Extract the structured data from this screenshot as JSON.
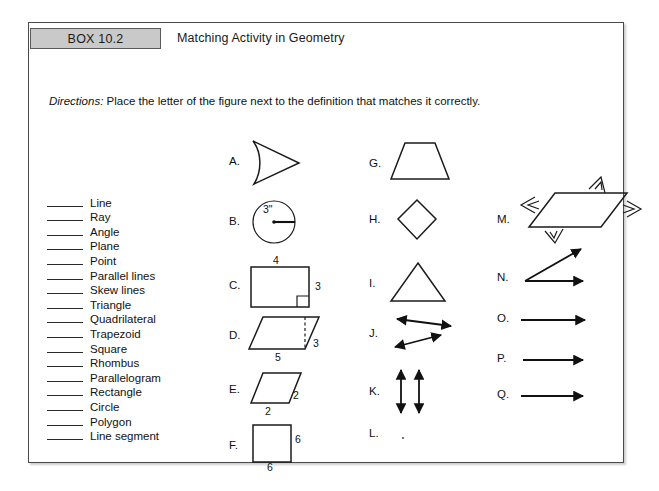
{
  "header": {
    "box_label": "BOX 10.2",
    "title": "Matching Activity in Geometry"
  },
  "directions": {
    "lead": "Directions:",
    "text": "Place the letter of the figure next to the definition that matches it correctly."
  },
  "definitions": [
    "Line",
    "Ray",
    "Angle",
    "Plane",
    "Point",
    "Parallel lines",
    "Skew lines",
    "Triangle",
    "Quadrilateral",
    "Trapezoid",
    "Square",
    "Rhombus",
    "Parallelogram",
    "Rectangle",
    "Circle",
    "Polygon",
    "Line segment"
  ],
  "figures": {
    "column1": [
      {
        "letter": "A.",
        "shape": "right-pointing-triangle",
        "dims": []
      },
      {
        "letter": "B.",
        "shape": "circle-with-radius",
        "dims": [
          "3\""
        ]
      },
      {
        "letter": "C.",
        "shape": "rectangle-with-right-angle",
        "dims": [
          "4",
          "3"
        ]
      },
      {
        "letter": "D.",
        "shape": "parallelogram-with-height",
        "dims": [
          "5",
          "3"
        ]
      },
      {
        "letter": "E.",
        "shape": "rhombus-slanted",
        "dims": [
          "2",
          "2"
        ]
      },
      {
        "letter": "F.",
        "shape": "square",
        "dims": [
          "6",
          "6"
        ]
      }
    ],
    "column2": [
      {
        "letter": "G.",
        "shape": "trapezoid",
        "dims": []
      },
      {
        "letter": "H.",
        "shape": "diamond",
        "dims": []
      },
      {
        "letter": "I.",
        "shape": "triangle",
        "dims": []
      },
      {
        "letter": "J.",
        "shape": "skew-lines",
        "dims": []
      },
      {
        "letter": "K.",
        "shape": "parallel-lines",
        "dims": []
      },
      {
        "letter": "L.",
        "shape": "point",
        "dims": []
      }
    ],
    "column3": [
      {
        "letter": "M.",
        "shape": "plane-parallelogram",
        "dims": []
      },
      {
        "letter": "N.",
        "shape": "angle",
        "dims": []
      },
      {
        "letter": "O.",
        "shape": "ray",
        "dims": []
      },
      {
        "letter": "P.",
        "shape": "ray",
        "dims": []
      },
      {
        "letter": "Q.",
        "shape": "ray",
        "dims": []
      }
    ]
  },
  "colors": {
    "box_tag_fill": "#c9c9c9",
    "frame_border": "#4a4a4a",
    "ink": "#1b1b1b",
    "page": "#ffffff"
  }
}
